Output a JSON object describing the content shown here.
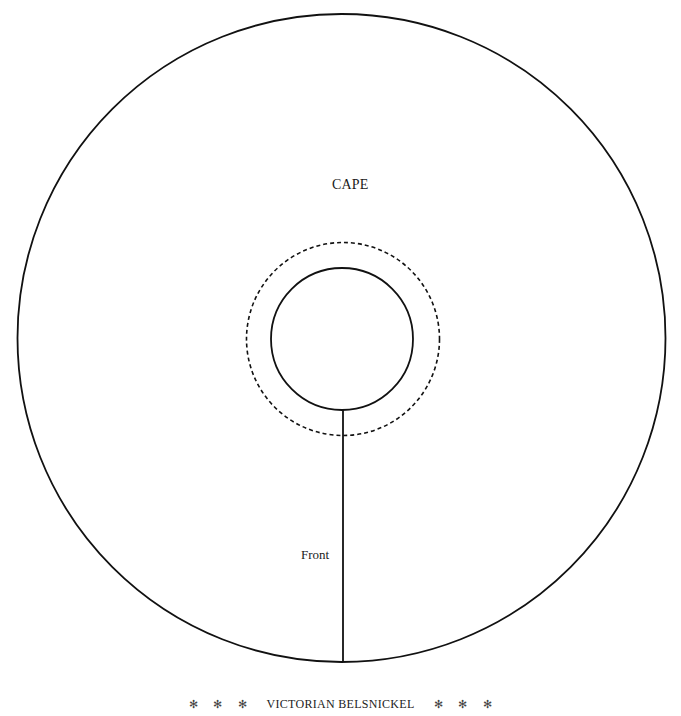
{
  "pattern": {
    "piece_label": "CAPE",
    "opening_label": "Front",
    "footer": {
      "stars_left": [
        "✻",
        "✻",
        "✻"
      ],
      "title": "VICTORIAN BELSNICKEL",
      "stars_right": [
        "✻",
        "✻",
        "✻"
      ]
    },
    "geometry": {
      "outer_circle": {
        "cx": 341.5,
        "cy": 338,
        "r": 324,
        "style": "solid"
      },
      "neck_circle": {
        "cx": 342,
        "cy": 339,
        "r": 71,
        "style": "solid"
      },
      "seam_allowance_circle": {
        "cx": 343,
        "cy": 339,
        "r": 96.5,
        "style": "dashed"
      },
      "front_cut_line": {
        "x": 343,
        "y1": 410,
        "y2": 662
      }
    },
    "colors": {
      "line": "#111111",
      "background": "#ffffff"
    }
  }
}
